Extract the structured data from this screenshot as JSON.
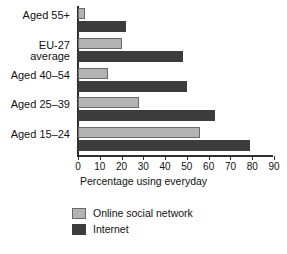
{
  "chart_data": {
    "type": "bar",
    "orientation": "horizontal",
    "title": "",
    "xlabel": "Percentage using everyday",
    "ylabel": "",
    "xlim": [
      0,
      90
    ],
    "xticks": [
      0,
      10,
      20,
      30,
      40,
      50,
      60,
      70,
      80,
      90
    ],
    "grid": false,
    "legend_position": "bottom-left",
    "categories": [
      "Aged 55+",
      "EU-27\naverage",
      "Aged 40–54",
      "Aged 25–39",
      "Aged 15–24"
    ],
    "series": [
      {
        "name": "Online social network",
        "color": "#b3b3b3",
        "values": [
          3,
          20,
          14,
          28,
          56
        ]
      },
      {
        "name": "Internet",
        "color": "#3c3c3c",
        "values": [
          22,
          48,
          50,
          63,
          79
        ]
      }
    ]
  },
  "legend": {
    "items": [
      {
        "label": "Online social network"
      },
      {
        "label": "Internet"
      }
    ]
  }
}
